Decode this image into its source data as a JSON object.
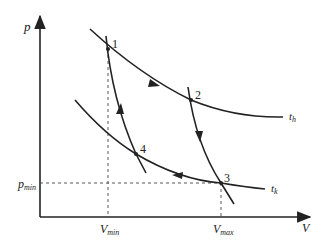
{
  "diagram": {
    "type": "p-V diagram (Carnot cycle)",
    "axes": {
      "y_label": "p",
      "x_label": "V"
    },
    "reference_lines": {
      "p_min": {
        "label": "p",
        "sub": "min"
      },
      "v_min": {
        "label": "V",
        "sub": "min"
      },
      "v_max": {
        "label": "V",
        "sub": "max"
      }
    },
    "isotherms": [
      {
        "name": "hot",
        "label": "t",
        "sub": "h"
      },
      {
        "name": "cold",
        "label": "t",
        "sub": "k"
      }
    ],
    "points": [
      {
        "id": "1",
        "label": "1"
      },
      {
        "id": "2",
        "label": "2"
      },
      {
        "id": "3",
        "label": "3"
      },
      {
        "id": "4",
        "label": "4"
      }
    ],
    "process_direction": [
      "1→2",
      "2→3",
      "3→4",
      "4→1"
    ],
    "colors": {
      "line": "#222222",
      "background": "#ffffff"
    }
  }
}
